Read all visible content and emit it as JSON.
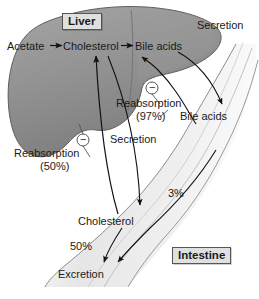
{
  "figure": {
    "organs": {
      "liver_label": "Liver",
      "intestine_label": "Intestine"
    },
    "liver_pathway": {
      "substrate": "Acetate",
      "intermediate": "Cholesterol",
      "product": "Bile acids"
    },
    "labels": {
      "secretion_top": "Secretion",
      "secretion_mid": "Secretion",
      "bile_acids_gut": "Bile acids",
      "reabsorption_bile_title": "Reabsorption",
      "reabsorption_bile_pct": "(97%)",
      "reabsorption_chol_title": "Reabsorption",
      "reabsorption_chol_pct": "(50%)",
      "gut_cholesterol": "Cholesterol",
      "loss_bile_pct": "3%",
      "loss_chol_pct": "50%",
      "excretion": "Excretion",
      "minus_sign_left": "−",
      "minus_sign_right": "−",
      "caption_remnant": ""
    },
    "colors": {
      "liver_fill": "#8f8f8f",
      "liver_stroke": "#5a5a5a",
      "intestine_fill": "#ececec",
      "intestine_stroke": "#8a8a8a",
      "arrow": "#111111",
      "box_fill": "#e0e0e0",
      "box_stroke": "#555555",
      "text": "#1a1a1a"
    }
  }
}
